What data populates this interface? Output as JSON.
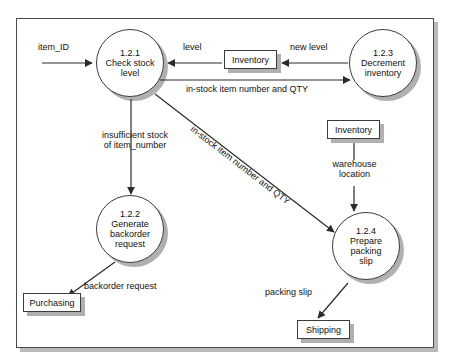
{
  "diagram": {
    "type": "data-flow-diagram",
    "frame_border_color": "#4a4a4a",
    "shadow_color": "#b0b0b0",
    "processes": [
      {
        "id": "1.2.1",
        "number": "1.2.1",
        "name_line1": "Check stock",
        "name_line2": "level",
        "name": "Check stock level"
      },
      {
        "id": "1.2.3",
        "number": "1.2.3",
        "name_line1": "Decrement",
        "name_line2": "inventory",
        "name": "Decrement inventory"
      },
      {
        "id": "1.2.2",
        "number": "1.2.2",
        "name_line1": "Generate",
        "name_line2": "backorder",
        "name_line3": "request",
        "name": "Generate backorder request"
      },
      {
        "id": "1.2.4",
        "number": "1.2.4",
        "name_line1": "Prepare",
        "name_line2": "packing",
        "name_line3": "slip",
        "name": "Prepare packing slip"
      }
    ],
    "data_stores": [
      {
        "id": "store-inventory-top",
        "label": "Inventory"
      },
      {
        "id": "store-inventory-right",
        "label": "Inventory"
      }
    ],
    "external_entities": [
      {
        "id": "entity-purchasing",
        "label": "Purchasing"
      },
      {
        "id": "entity-shipping",
        "label": "Shipping"
      }
    ],
    "flows": [
      {
        "id": "flow-item-id",
        "label": "item_ID",
        "from": "external-input",
        "to": "1.2.1"
      },
      {
        "id": "flow-level",
        "label": "level",
        "from": "store-inventory-top",
        "to": "1.2.1"
      },
      {
        "id": "flow-new-level",
        "label": "new level",
        "from": "1.2.3",
        "to": "store-inventory-top"
      },
      {
        "id": "flow-instock-top",
        "label": "in-stock item number and QTY",
        "from": "1.2.1",
        "to": "1.2.3"
      },
      {
        "id": "flow-insufficient",
        "label_line1": "insufficient stock",
        "label_line2": "of item_number",
        "label": "insufficient stock of item_number",
        "from": "1.2.1",
        "to": "1.2.2"
      },
      {
        "id": "flow-instock-diagonal",
        "label": "in-stock item number and QTY",
        "from": "1.2.1",
        "to": "1.2.4"
      },
      {
        "id": "flow-warehouse",
        "label_line1": "warehouse",
        "label_line2": "location",
        "label": "warehouse location",
        "from": "store-inventory-right",
        "to": "1.2.4"
      },
      {
        "id": "flow-backorder",
        "label": "backorder request",
        "from": "1.2.2",
        "to": "entity-purchasing"
      },
      {
        "id": "flow-packing-slip",
        "label": "packing slip",
        "from": "1.2.4",
        "to": "entity-shipping"
      }
    ]
  }
}
